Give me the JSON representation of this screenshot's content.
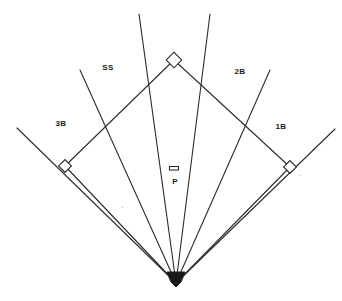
{
  "diagram": {
    "stroke_color": "#2b2b2b",
    "background_color": "#ffffff",
    "label_color": "#1a1a1a",
    "width": 342,
    "height": 301
  },
  "labels": {
    "shortstop": "SS",
    "third_base": "3B",
    "second_base": "2B",
    "first_base": "1B",
    "pitcher": "P"
  },
  "label_positions": {
    "shortstop": {
      "x": 108,
      "y": 67
    },
    "third_base": {
      "x": 61,
      "y": 123
    },
    "second_base": {
      "x": 240,
      "y": 71
    },
    "first_base": {
      "x": 281,
      "y": 126
    },
    "pitcher": {
      "x": 175,
      "y": 181
    }
  },
  "geometry": {
    "home_plate": {
      "x": 176,
      "y": 283
    },
    "second_base_bag": {
      "x": 174,
      "y": 60
    },
    "third_base_bag": {
      "x": 65,
      "y": 166
    },
    "first_base_bag": {
      "x": 290,
      "y": 167
    },
    "pitchers_rubber": {
      "x": 174,
      "y": 168,
      "width": 9,
      "height": 3
    },
    "base_diamond_size": 9,
    "second_base_diamond_size": 11,
    "foul_line_left_end": {
      "x": 17,
      "y": 128
    },
    "foul_line_right_end": {
      "x": 335,
      "y": 129
    },
    "fielder_line_3b_end": {
      "x": 80,
      "y": 70
    },
    "fielder_line_ss_end": {
      "x": 139,
      "y": 14
    },
    "fielder_line_2b_end": {
      "x": 210,
      "y": 14
    },
    "fielder_line_1b_end": {
      "x": 270,
      "y": 70
    }
  },
  "lines": [
    {
      "name": "left-foul-line",
      "x1": 176,
      "y1": 283,
      "x2": 17,
      "y2": 128
    },
    {
      "name": "right-foul-line",
      "x1": 176,
      "y1": 283,
      "x2": 335,
      "y2": 129
    },
    {
      "name": "third-base-fielder-line",
      "x1": 176,
      "y1": 283,
      "x2": 80,
      "y2": 70
    },
    {
      "name": "shortstop-fielder-line",
      "x1": 176,
      "y1": 283,
      "x2": 139,
      "y2": 14
    },
    {
      "name": "second-base-fielder-line",
      "x1": 176,
      "y1": 283,
      "x2": 210,
      "y2": 14
    },
    {
      "name": "first-base-fielder-line",
      "x1": 176,
      "y1": 283,
      "x2": 270,
      "y2": 70
    },
    {
      "name": "baseline-home-to-third",
      "x1": 176,
      "y1": 283,
      "x2": 65,
      "y2": 166
    },
    {
      "name": "baseline-third-to-second",
      "x1": 65,
      "y1": 166,
      "x2": 174,
      "y2": 60
    },
    {
      "name": "baseline-second-to-first",
      "x1": 174,
      "y1": 60,
      "x2": 290,
      "y2": 167
    },
    {
      "name": "baseline-first-to-home",
      "x1": 290,
      "y1": 167,
      "x2": 176,
      "y2": 283
    }
  ],
  "specks": [
    {
      "x": 122,
      "y": 207
    },
    {
      "x": 300,
      "y": 175
    }
  ]
}
